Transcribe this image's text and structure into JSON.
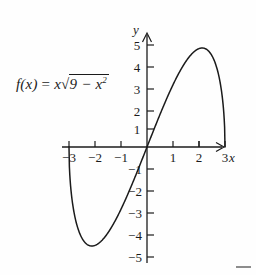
{
  "figure": {
    "name": "function-graph",
    "background_color": "#fefefe",
    "ink_color": "#1b1b1b",
    "corner_mark_color": "#8d8d8d"
  },
  "formula": {
    "lhs": "f(x)",
    "equals": "=",
    "coefficient": "x",
    "radical_sign": "√",
    "radicand_lead": "9 − x",
    "radicand_exponent": "2",
    "full_text": "f(x) = x√(9 − x²)"
  },
  "axes": {
    "x_label": "x",
    "y_label": "y",
    "x_ticks": [
      {
        "value": -3,
        "label": "−3"
      },
      {
        "value": -2,
        "label": "−2"
      },
      {
        "value": -1,
        "label": "−1"
      },
      {
        "value": 1,
        "label": "1"
      },
      {
        "value": 2,
        "label": "2"
      },
      {
        "value": 3,
        "label": "3"
      }
    ],
    "y_ticks": [
      {
        "value": 5,
        "label": "5"
      },
      {
        "value": 4,
        "label": "4"
      },
      {
        "value": 3,
        "label": "3"
      },
      {
        "value": 2,
        "label": "2"
      },
      {
        "value": 1,
        "label": "1"
      },
      {
        "value": -1,
        "label": "−1"
      },
      {
        "value": -2,
        "label": "−2"
      },
      {
        "value": -3,
        "label": "−3"
      },
      {
        "value": -4,
        "label": "−4"
      },
      {
        "value": -5,
        "label": "−5"
      }
    ]
  },
  "chart_data": {
    "type": "line",
    "title": "",
    "subtitle": "",
    "xlabel": "x",
    "ylabel": "y",
    "annotations": [
      "f(x) = x√(9 − x²)"
    ],
    "grid": false,
    "legend": null,
    "xlim": [
      -3.4,
      3.6
    ],
    "ylim": [
      -5.6,
      5.6
    ],
    "x_ticks": [
      -3,
      -2,
      -1,
      1,
      2,
      3
    ],
    "y_ticks": [
      5,
      4,
      3,
      2,
      1,
      -1,
      -2,
      -3,
      -4,
      -5
    ],
    "series": [
      {
        "name": "f(x) = x*sqrt(9 - x^2)",
        "domain": [
          -3,
          3
        ],
        "x": [
          -3.0,
          -2.9,
          -2.8,
          -2.7,
          -2.6,
          -2.5,
          -2.4,
          -2.3,
          -2.2,
          -2.121,
          -2.0,
          -1.9,
          -1.8,
          -1.6,
          -1.4,
          -1.2,
          -1.0,
          -0.8,
          -0.6,
          -0.4,
          -0.2,
          0.0,
          0.2,
          0.4,
          0.6,
          0.8,
          1.0,
          1.2,
          1.4,
          1.6,
          1.8,
          1.9,
          2.0,
          2.121,
          2.2,
          2.3,
          2.4,
          2.5,
          2.6,
          2.7,
          2.8,
          2.9,
          3.0
        ],
        "y": [
          0.0,
          -2.24,
          -3.07,
          -3.62,
          -4.0,
          -4.15,
          -4.32,
          -4.41,
          -4.47,
          -4.5,
          -4.47,
          -4.35,
          -4.18,
          -3.71,
          -3.12,
          -2.47,
          -1.77,
          -1.03,
          -0.27,
          0.0,
          0.0,
          0.0,
          0.0,
          0.0,
          0.27,
          1.03,
          1.77,
          2.47,
          3.12,
          3.71,
          4.18,
          4.35,
          4.47,
          4.5,
          4.47,
          4.41,
          4.32,
          4.15,
          4.0,
          3.62,
          3.07,
          2.24,
          0.0
        ],
        "key_points": [
          {
            "label": "left-zero",
            "x": -3,
            "y": 0
          },
          {
            "label": "minimum",
            "x": -2.121,
            "y": -4.5
          },
          {
            "label": "origin-zero",
            "x": 0,
            "y": 0
          },
          {
            "label": "maximum",
            "x": 2.121,
            "y": 4.5
          },
          {
            "label": "right-zero",
            "x": 3,
            "y": 0
          }
        ]
      }
    ]
  }
}
